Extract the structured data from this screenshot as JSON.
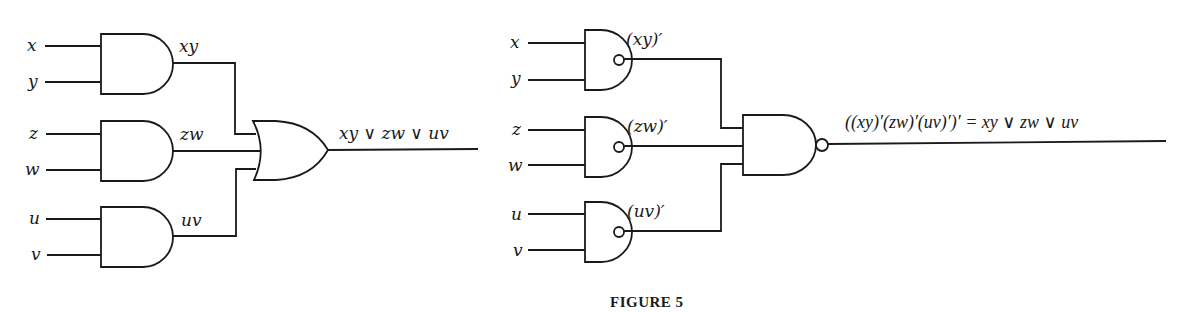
{
  "figure": {
    "caption": "FIGURE 5"
  },
  "left_circuit": {
    "inputs": [
      "x",
      "y",
      "z",
      "w",
      "u",
      "v"
    ],
    "and_gates": [
      {
        "output_label": "xy"
      },
      {
        "output_label": "zw"
      },
      {
        "output_label": "uv"
      }
    ],
    "or_gate": {
      "output_label": "xy ∨ zw ∨ uv"
    }
  },
  "right_circuit": {
    "inputs": [
      "x",
      "y",
      "z",
      "w",
      "u",
      "v"
    ],
    "nand_gates": [
      {
        "output_label": "(xy)′"
      },
      {
        "output_label": "(zw)′"
      },
      {
        "output_label": "(uv)′"
      }
    ],
    "final_nand_gate": {
      "output_label": "((xy)′(zw)′(uv)′)′ = xy ∨ zw ∨ uv"
    }
  }
}
